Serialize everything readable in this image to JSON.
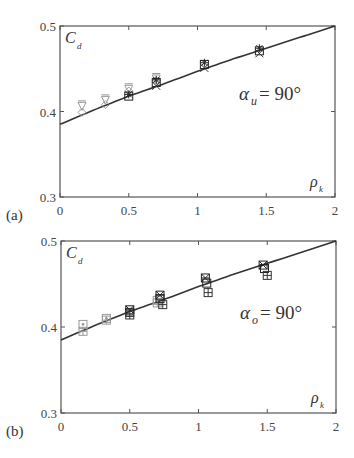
{
  "chart_data": [
    {
      "panel": "(a)",
      "type": "scatter",
      "title": "",
      "xlabel": "ρ_k",
      "ylabel": "C_d",
      "annotation": {
        "symbol": "α",
        "subscript": "u",
        "text": "= 90°"
      },
      "xlim": [
        0,
        2
      ],
      "ylim": [
        0.3,
        0.5
      ],
      "xticks": [
        0,
        0.5,
        1,
        1.5,
        2
      ],
      "xtick_labels": [
        "0",
        "0.5",
        "1",
        "1.5",
        "2"
      ],
      "yticks": [
        0.3,
        0.4,
        0.5
      ],
      "ytick_labels": [
        "0.3",
        "0.4",
        "0.5"
      ],
      "grid": false,
      "curve": {
        "name": "model",
        "x": [
          0,
          0.25,
          0.5,
          0.75,
          1.0,
          1.25,
          1.5,
          1.75,
          2.0
        ],
        "y": [
          0.385,
          0.402,
          0.418,
          0.432,
          0.447,
          0.461,
          0.474,
          0.487,
          0.5
        ]
      },
      "series": [
        {
          "name": "gray-triangle",
          "marker": "triangle",
          "color": "#999999",
          "x": [
            0.16,
            0.33,
            0.5,
            0.7
          ],
          "y": [
            0.406,
            0.413,
            0.426,
            0.438
          ]
        },
        {
          "name": "gray-diamond",
          "marker": "diamond",
          "color": "#999999",
          "x": [
            0.16,
            0.33,
            0.5,
            0.7
          ],
          "y": [
            0.399,
            0.408,
            0.424,
            0.436
          ]
        },
        {
          "name": "dark-asterisk",
          "marker": "asterisk",
          "color": "#222222",
          "x": [
            0.5,
            0.7,
            1.05,
            1.45
          ],
          "y": [
            0.42,
            0.437,
            0.457,
            0.474
          ]
        },
        {
          "name": "dark-square",
          "marker": "square",
          "color": "#222222",
          "x": [
            0.5,
            0.7,
            1.05,
            1.45
          ],
          "y": [
            0.418,
            0.434,
            0.455,
            0.471
          ]
        },
        {
          "name": "dark-cross",
          "marker": "x",
          "color": "#333333",
          "x": [
            0.7,
            1.05,
            1.45
          ],
          "y": [
            0.43,
            0.451,
            0.468
          ]
        }
      ]
    },
    {
      "panel": "(b)",
      "type": "scatter",
      "title": "",
      "xlabel": "ρ_k",
      "ylabel": "C_d",
      "annotation": {
        "symbol": "α",
        "subscript": "o",
        "text": "= 90°"
      },
      "xlim": [
        0,
        2
      ],
      "ylim": [
        0.3,
        0.5
      ],
      "xticks": [
        0,
        0.5,
        1,
        1.5,
        2
      ],
      "xtick_labels": [
        "0",
        "0.5",
        "1",
        "1.5",
        "2"
      ],
      "yticks": [
        0.3,
        0.4,
        0.5
      ],
      "ytick_labels": [
        "0.3",
        "0.4",
        "0.5"
      ],
      "grid": false,
      "curve": {
        "name": "model",
        "x": [
          0,
          0.25,
          0.5,
          0.75,
          1.0,
          1.25,
          1.5,
          1.75,
          2.0
        ],
        "y": [
          0.385,
          0.402,
          0.418,
          0.432,
          0.447,
          0.461,
          0.474,
          0.487,
          0.5
        ]
      },
      "series": [
        {
          "name": "gray-square-dot",
          "marker": "square-dot",
          "color": "#999999",
          "x": [
            0.16,
            0.33,
            0.7
          ],
          "y": [
            0.403,
            0.41,
            0.431
          ]
        },
        {
          "name": "gray-square-grid",
          "marker": "square-grid",
          "color": "#999999",
          "x": [
            0.16,
            0.33,
            0.7
          ],
          "y": [
            0.395,
            0.408,
            0.428
          ]
        },
        {
          "name": "dark-square-star",
          "marker": "square-star",
          "color": "#222222",
          "x": [
            0.5,
            0.72,
            1.05,
            1.47
          ],
          "y": [
            0.42,
            0.437,
            0.457,
            0.472
          ]
        },
        {
          "name": "dark-square",
          "marker": "square",
          "color": "#222222",
          "x": [
            0.5,
            0.72,
            1.06,
            1.48
          ],
          "y": [
            0.417,
            0.433,
            0.451,
            0.468
          ]
        },
        {
          "name": "dark-square-grid",
          "marker": "square-grid",
          "color": "#333333",
          "x": [
            0.5,
            0.74,
            1.07,
            1.5
          ],
          "y": [
            0.414,
            0.426,
            0.44,
            0.46
          ]
        }
      ]
    }
  ]
}
